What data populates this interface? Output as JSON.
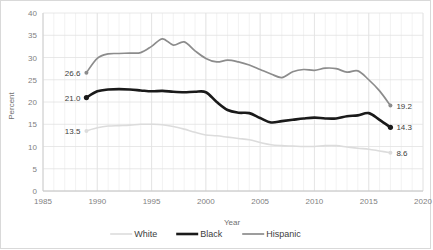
{
  "chart_data": {
    "type": "line",
    "title": "",
    "xlabel": "Year",
    "ylabel": "Percent",
    "xlim": [
      1985,
      2020
    ],
    "ylim": [
      0,
      40
    ],
    "xticks": [
      "1985",
      "1990",
      "1995",
      "2000",
      "2005",
      "2010",
      "2015",
      "2020"
    ],
    "yticks": [
      "0",
      "5",
      "10",
      "15",
      "20",
      "25",
      "30",
      "35",
      "40"
    ],
    "grid": "minor-vertical-yearly-and-horizontal-major",
    "legend_position": "bottom-center",
    "x": [
      1989,
      1990,
      1991,
      1992,
      1993,
      1994,
      1995,
      1996,
      1997,
      1998,
      1999,
      2000,
      2001,
      2002,
      2003,
      2004,
      2005,
      2006,
      2007,
      2008,
      2009,
      2010,
      2011,
      2012,
      2013,
      2014,
      2015,
      2016,
      2017
    ],
    "series": [
      {
        "name": "White",
        "color": "#dcdcdc",
        "width": 1.6,
        "values": [
          13.5,
          14.2,
          14.6,
          14.7,
          14.8,
          15.0,
          15.0,
          14.9,
          14.5,
          13.9,
          13.2,
          12.6,
          12.4,
          12.1,
          11.8,
          11.5,
          10.9,
          10.4,
          10.2,
          10.1,
          10.0,
          10.0,
          10.2,
          10.2,
          9.9,
          9.6,
          9.4,
          9.0,
          8.6
        ],
        "start_label": "13.5",
        "end_label": "8.6"
      },
      {
        "name": "Black",
        "color": "#1a1a1a",
        "width": 2.6,
        "values": [
          21.0,
          22.4,
          22.8,
          22.9,
          22.8,
          22.6,
          22.4,
          22.5,
          22.3,
          22.2,
          22.3,
          22.2,
          20.0,
          18.2,
          17.6,
          17.5,
          16.4,
          15.4,
          15.7,
          16.0,
          16.3,
          16.5,
          16.3,
          16.3,
          16.8,
          17.0,
          17.5,
          16.0,
          14.3
        ],
        "start_label": "21.0",
        "end_label": "14.3"
      },
      {
        "name": "Hispanic",
        "color": "#8c8c8c",
        "width": 1.7,
        "values": [
          26.6,
          29.8,
          30.8,
          30.9,
          31.0,
          31.1,
          32.5,
          34.2,
          32.8,
          33.5,
          31.5,
          29.8,
          29.0,
          29.4,
          29.0,
          28.3,
          27.3,
          26.3,
          25.5,
          26.8,
          27.3,
          27.1,
          27.6,
          27.5,
          26.7,
          27.0,
          25.0,
          22.5,
          19.2
        ],
        "start_label": "26.6",
        "end_label": "19.2"
      }
    ]
  },
  "legend": {
    "items": [
      {
        "label": "White"
      },
      {
        "label": "Black"
      },
      {
        "label": "Hispanic"
      }
    ]
  }
}
